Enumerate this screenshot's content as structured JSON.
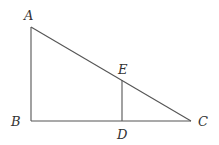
{
  "diagram": {
    "type": "geometry",
    "points": {
      "A": {
        "label": "A",
        "x": 31,
        "y": 27
      },
      "B": {
        "label": "B",
        "x": 31,
        "y": 121
      },
      "C": {
        "label": "C",
        "x": 191,
        "y": 121
      },
      "D": {
        "label": "D",
        "x": 122,
        "y": 121
      },
      "E": {
        "label": "E",
        "x": 122,
        "y": 80
      }
    },
    "segments": [
      "AB",
      "BC",
      "AC",
      "DE"
    ],
    "colors": {
      "stroke": "#555555",
      "label": "#333333",
      "background": "#ffffff"
    }
  }
}
